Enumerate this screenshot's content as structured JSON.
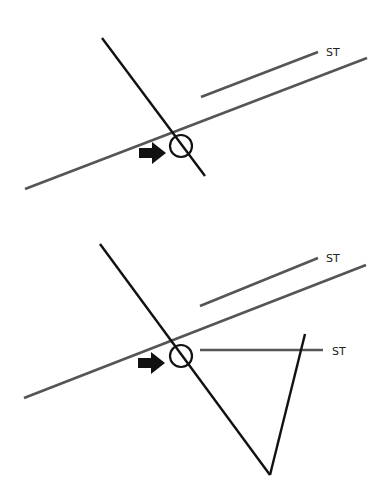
{
  "colors": {
    "background": "#ffffff",
    "black_line": "#111111",
    "gray_line": "#555555"
  },
  "diagram_top": {
    "label_st": "ST",
    "black_line": {
      "x1": 102,
      "y1": 38,
      "x2": 205,
      "y2": 176
    },
    "gray_long": {
      "x1": 25,
      "y1": 189,
      "x2": 367,
      "y2": 58
    },
    "gray_short": {
      "x1": 201,
      "y1": 97,
      "x2": 318,
      "y2": 52
    },
    "circle": {
      "cx": 181,
      "cy": 146,
      "r": 11
    },
    "arrow_tip": {
      "x": 166,
      "y": 153
    }
  },
  "diagram_bottom": {
    "label_st_upper": "ST",
    "label_st_lower": "ST",
    "black_line": {
      "x1": 100,
      "y1": 244,
      "x2": 270,
      "y2": 475
    },
    "right_line": {
      "x1": 270,
      "y1": 475,
      "x2": 305,
      "y2": 334
    },
    "gray_long": {
      "x1": 24,
      "y1": 398,
      "x2": 366,
      "y2": 265
    },
    "gray_short": {
      "x1": 200,
      "y1": 306,
      "x2": 318,
      "y2": 258
    },
    "gray_horizontal": {
      "x1": 200,
      "y1": 350,
      "x2": 323,
      "y2": 350
    },
    "circle": {
      "cx": 181,
      "cy": 356,
      "r": 11
    },
    "arrow_tip": {
      "x": 165,
      "y": 363
    }
  }
}
